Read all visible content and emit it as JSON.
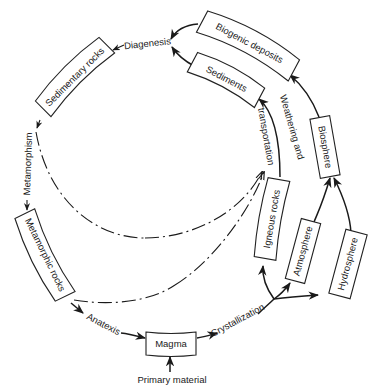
{
  "diagram": {
    "nodes": {
      "biogenic_deposits": "Biogenic deposits",
      "sediments": "Sediments",
      "sedimentary_rocks": "Sedimentary rocks",
      "metamorphic_rocks": "Metamorphic rocks",
      "magma": "Magma",
      "igneous_rocks": "Igneous rocks",
      "atmosphere": "Atmosphere",
      "hydrosphere": "Hydrosphere",
      "biosphere": "Biosphere"
    },
    "processes": {
      "diagenesis": "Diagenesis",
      "metamorphism": "Metamorphism",
      "anatexis": "Anatexis",
      "crystallization": "Crystallization",
      "weathering": "Weathering and",
      "transportation": "transportation",
      "primary_material": "Primary material"
    },
    "colors": {
      "ink": "#1a1a1a",
      "background": "#ffffff"
    }
  }
}
